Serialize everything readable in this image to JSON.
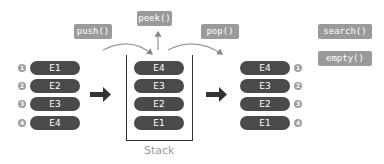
{
  "operations": {
    "push": "push()",
    "peek": "peek()",
    "pop": "pop()",
    "search": "search()",
    "empty": "empty()"
  },
  "input_list": {
    "items": [
      {
        "order": "1",
        "label": "E1"
      },
      {
        "order": "2",
        "label": "E2"
      },
      {
        "order": "3",
        "label": "E3"
      },
      {
        "order": "4",
        "label": "E4"
      }
    ]
  },
  "stack": {
    "label": "Stack",
    "items": [
      "E4",
      "E3",
      "E2",
      "E1"
    ]
  },
  "output_list": {
    "items": [
      {
        "order": "1",
        "label": "E4"
      },
      {
        "order": "2",
        "label": "E3"
      },
      {
        "order": "3",
        "label": "E2"
      },
      {
        "order": "4",
        "label": "E1"
      }
    ]
  },
  "colors": {
    "element_fill": "#4a4a4a",
    "operation_fill": "#9a9a9a",
    "order_badge": "#9e9e9e",
    "arrow": "#333333"
  }
}
